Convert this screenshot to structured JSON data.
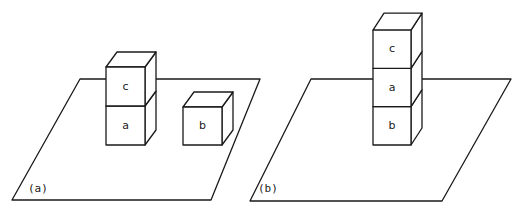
{
  "figure": {
    "panels": [
      {
        "caption": "(a)",
        "stacks": [
          {
            "blocks_bottom_to_top": [
              "a",
              "c"
            ]
          },
          {
            "blocks_bottom_to_top": [
              "b"
            ]
          }
        ]
      },
      {
        "caption": "(b)",
        "stacks": [
          {
            "blocks_bottom_to_top": [
              "b",
              "a",
              "c"
            ]
          }
        ]
      }
    ]
  },
  "colors": {
    "stroke": "#1a1a1a",
    "background": "#ffffff"
  }
}
